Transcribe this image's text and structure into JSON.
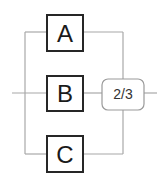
{
  "diagram": {
    "type": "reliability-block-diagram",
    "blocks": [
      {
        "id": "A",
        "label": "A"
      },
      {
        "id": "B",
        "label": "B"
      },
      {
        "id": "C",
        "label": "C"
      }
    ],
    "voter": {
      "label": "2/3"
    },
    "colors": {
      "wire": "#a8a8a8",
      "block_border": "#262626",
      "voter_border": "#9a9a9a",
      "text": "#1a1a1a"
    }
  }
}
